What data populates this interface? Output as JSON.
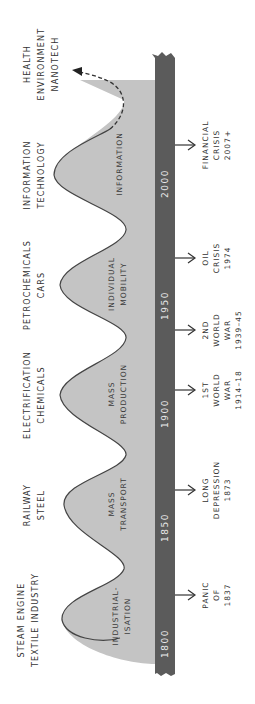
{
  "diagram": {
    "type": "kondratiev-waves",
    "orientation": "rotated-90-ccw",
    "colors": {
      "wave_fill": "#c4c4c4",
      "wave_outline": "#444444",
      "timeline_bar": "#5b5b5b",
      "year_text": "#e9e9e9",
      "label_text": "#333333"
    },
    "waves": [
      {
        "technology_line1": "STEAM ENGINE",
        "technology_line2": "TEXTILE INDUSTRY",
        "theme_line1": "INDUSTRIAL-",
        "theme_line2": "ISATION"
      },
      {
        "technology_line1": "RAILWAY",
        "technology_line2": "STEEL",
        "theme_line1": "MASS",
        "theme_line2": "TRANSPORT"
      },
      {
        "technology_line1": "ELECTRIFICATION",
        "technology_line2": "CHEMICALS",
        "theme_line1": "MASS",
        "theme_line2": "PRODUCTION"
      },
      {
        "technology_line1": "PETROCHEMICALS",
        "technology_line2": "CARS",
        "theme_line1": "INDIVIDUAL",
        "theme_line2": "MOBILITY"
      },
      {
        "technology_line1": "INFORMATION",
        "technology_line2": "TECHNOLOGY",
        "theme_line1": "INFORMATION",
        "theme_line2": ""
      },
      {
        "technology_line1": "HEALTH",
        "technology_line2": "ENVIRONMENT",
        "technology_line3": "NANOTECH",
        "projected": true
      }
    ],
    "timeline": {
      "years": [
        "1800",
        "1850",
        "1900",
        "1950",
        "2000"
      ]
    },
    "events": [
      {
        "line1": "PANIC",
        "line2": "OF",
        "line3": "1837"
      },
      {
        "line1": "LONG",
        "line2": "DEPRESSION",
        "line3": "1873"
      },
      {
        "line1": "1ST",
        "line2": "WORLD",
        "line3": "WAR",
        "line4": "1914–18"
      },
      {
        "line1": "2ND",
        "line2": "WORLD",
        "line3": "WAR",
        "line4": "1939–45"
      },
      {
        "line1": "OIL",
        "line2": "CRISIS",
        "line3": "1974"
      },
      {
        "line1": "FINANCIAL",
        "line2": "CRISIS",
        "line3": "2007+"
      }
    ]
  }
}
